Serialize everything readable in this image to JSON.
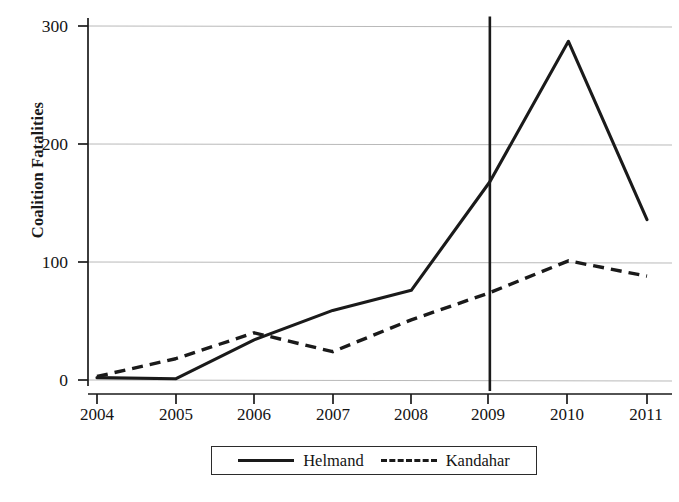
{
  "chart_data": {
    "type": "line",
    "title": "",
    "xlabel": "",
    "ylabel": "Coalition Fatalities",
    "categories": [
      "2004",
      "2005",
      "2006",
      "2007",
      "2008",
      "2009",
      "2010",
      "2011"
    ],
    "x": [
      2004,
      2005,
      2006,
      2007,
      2008,
      2009,
      2010,
      2011
    ],
    "xlim": [
      2004,
      2011
    ],
    "ylim": [
      0,
      300
    ],
    "yticks": [
      0,
      100,
      200,
      300
    ],
    "ytick_labels": [
      "0",
      "100",
      "200",
      "300"
    ],
    "grid": "horizontal",
    "legend_position": "bottom-center",
    "series": [
      {
        "name": "Helmand",
        "style": "solid",
        "color": "#1a1a1a",
        "values": [
          2,
          1,
          34,
          59,
          76,
          168,
          287,
          136
        ]
      },
      {
        "name": "Kandahar",
        "style": "dashed",
        "color": "#1a1a1a",
        "values": [
          3,
          18,
          40,
          24,
          51,
          74,
          101,
          88
        ]
      }
    ],
    "annotations": [
      {
        "type": "vertical-reference-line",
        "x": 2009,
        "y_from": 0,
        "y_to": 308,
        "color": "#1a1a1a"
      }
    ]
  },
  "axes": {
    "y_title": "Coalition Fatalities",
    "y_ticks": [
      {
        "label": "300"
      },
      {
        "label": "200"
      },
      {
        "label": "100"
      },
      {
        "label": "0"
      }
    ],
    "x_ticks": [
      {
        "label": "2004"
      },
      {
        "label": "2005"
      },
      {
        "label": "2006"
      },
      {
        "label": "2007"
      },
      {
        "label": "2008"
      },
      {
        "label": "2009"
      },
      {
        "label": "2010"
      },
      {
        "label": "2011"
      }
    ]
  },
  "legend": {
    "entries": [
      {
        "label": "Helmand",
        "style": "solid"
      },
      {
        "label": "Kandahar",
        "style": "dashed"
      }
    ]
  }
}
